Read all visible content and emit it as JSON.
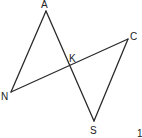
{
  "diagram": {
    "type": "geometry",
    "points": {
      "A": {
        "label": "A",
        "x": 46,
        "y": 11
      },
      "N": {
        "label": "N",
        "x": 11,
        "y": 92
      },
      "K": {
        "label": "K",
        "x": 70,
        "y": 67
      },
      "C": {
        "label": "C",
        "x": 128,
        "y": 39
      },
      "S": {
        "label": "S",
        "x": 94,
        "y": 121
      }
    },
    "segments": [
      [
        "A",
        "N"
      ],
      [
        "A",
        "S"
      ],
      [
        "N",
        "C"
      ],
      [
        "C",
        "S"
      ]
    ],
    "corner_mark": "1"
  }
}
